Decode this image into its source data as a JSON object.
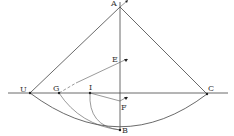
{
  "diagram": {
    "type": "geometric-construction",
    "points": [
      {
        "id": "A",
        "label": "A",
        "x": 120,
        "y": 7
      },
      {
        "id": "B",
        "label": "B",
        "x": 120,
        "y": 130
      },
      {
        "id": "C",
        "label": "C",
        "x": 207,
        "y": 94
      },
      {
        "id": "D",
        "label": "U",
        "x": 30,
        "y": 93
      },
      {
        "id": "E",
        "label": "E",
        "x": 120,
        "y": 65
      },
      {
        "id": "F",
        "label": "F",
        "x": 120,
        "y": 101
      },
      {
        "id": "G",
        "label": "G",
        "x": 59,
        "y": 93
      },
      {
        "id": "I",
        "label": "I",
        "x": 90,
        "y": 93
      }
    ],
    "labels": {
      "A": "A",
      "B": "B",
      "C": "C",
      "D": "U",
      "E": "E",
      "F": "F",
      "G": "G",
      "I": "I"
    },
    "colors": {
      "line": "#444444",
      "background": "#ffffff"
    }
  }
}
